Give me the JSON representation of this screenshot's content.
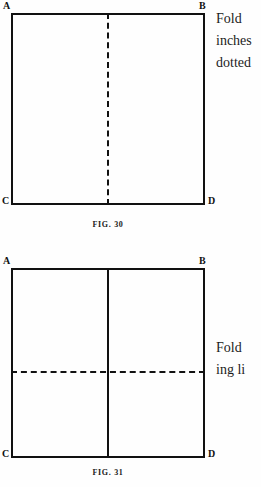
{
  "page": {
    "background_color": "#fefefe",
    "ink_color": "#111111"
  },
  "figures": [
    {
      "id": "figure-30",
      "caption": "FIG. 30",
      "vertices": {
        "top_left": "A",
        "top_right": "B",
        "bottom_left": "C",
        "bottom_right": "D"
      },
      "fold_lines": [
        {
          "name": "vertical-center-fold",
          "style": "dashed",
          "orientation": "vertical"
        }
      ],
      "margin_text": [
        "Fold",
        "inches",
        "dotted"
      ]
    },
    {
      "id": "figure-31",
      "caption": "FIG. 31",
      "vertices": {
        "top_left": "A",
        "top_right": "B",
        "bottom_left": "C",
        "bottom_right": "D"
      },
      "fold_lines": [
        {
          "name": "vertical-center-crease",
          "style": "solid",
          "orientation": "vertical"
        },
        {
          "name": "horizontal-center-fold",
          "style": "dashed",
          "orientation": "horizontal"
        }
      ],
      "margin_text": [
        "Fold",
        "ing li"
      ]
    }
  ]
}
